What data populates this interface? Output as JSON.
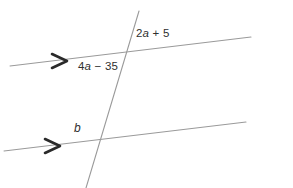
{
  "caption": {
    "text": "Find the value of b on a number line."
  },
  "figure": {
    "type": "geometry-diagram",
    "stroke_color": "#9a9a9a",
    "marker_color": "#2a2a2a",
    "label_color": "#2f2f2f",
    "background": "#ffffff",
    "lines": [
      {
        "name": "upper-parallel-line",
        "x1": 10,
        "y1": 66,
        "x2": 251,
        "y2": 37,
        "arrow_mark": {
          "x": 62,
          "y": 60
        }
      },
      {
        "name": "lower-parallel-line",
        "x1": 4,
        "y1": 151,
        "x2": 246,
        "y2": 122,
        "arrow_mark": {
          "x": 55,
          "y": 145
        }
      },
      {
        "name": "transversal-line",
        "x1": 139,
        "y1": 11,
        "x2": 86,
        "y2": 188
      }
    ],
    "labels": [
      {
        "name": "angle-label-top-right",
        "text": "2a + 5",
        "var": "a",
        "x": 136,
        "y": 27
      },
      {
        "name": "angle-label-top-left",
        "text": "4a − 35",
        "var": "a",
        "x": 78,
        "y": 60
      },
      {
        "name": "angle-label-bottom",
        "text": "b",
        "var": "b",
        "x": 74,
        "y": 121
      }
    ]
  }
}
